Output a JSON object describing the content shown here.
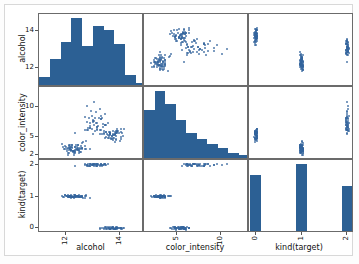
{
  "figure": {
    "kind": "scatterplot-matrix",
    "accent_color": "#2c6094",
    "point_color": "#32639b",
    "axis_color": "#6b6b6b"
  },
  "variables": [
    "alcohol",
    "color_intensity",
    "kind(target)"
  ],
  "axis_labels": {
    "x": [
      "alcohol",
      "color_intensity",
      "kind(target)"
    ],
    "y": [
      "alcohol",
      "color_intensity",
      "kind(target)"
    ]
  },
  "ticks": {
    "alcohol_x": [
      "12",
      "14"
    ],
    "alcohol_y": [
      "12",
      "14"
    ],
    "color_intensity_x": [
      "5",
      "10"
    ],
    "color_intensity_y": [
      "2",
      "5",
      "10"
    ],
    "target_x": [
      "0",
      "1",
      "2"
    ],
    "target_y": [
      "0",
      "1",
      "2"
    ]
  },
  "chart_data": {
    "type": "scatter",
    "title": "",
    "subtitle": "",
    "layout": "3x3 pair plot (scatter matrix); diagonal = histograms",
    "grid": false,
    "legend": "none",
    "variables": [
      {
        "name": "alcohol",
        "xlim": [
          11.0,
          14.9
        ],
        "ylim": [
          11.0,
          14.9
        ],
        "ticks": [
          12,
          14
        ]
      },
      {
        "name": "color_intensity",
        "xlim": [
          1.2,
          13.2
        ],
        "ylim": [
          1.2,
          13.2
        ],
        "ticks": [
          2,
          5,
          10
        ]
      },
      {
        "name": "kind(target)",
        "xlim": [
          -0.15,
          2.15
        ],
        "ylim": [
          -0.15,
          2.15
        ],
        "ticks": [
          0,
          1,
          2
        ]
      }
    ],
    "panels": [
      {
        "row": 0,
        "col": 0,
        "type": "histogram",
        "xlabel": "alcohol",
        "ylabel": "alcohol",
        "bin_edges": [
          11.0,
          11.4,
          11.8,
          12.2,
          12.6,
          13.0,
          13.4,
          13.8,
          14.2,
          14.6,
          15.0
        ],
        "counts": [
          4,
          13,
          22,
          34,
          20,
          30,
          28,
          21,
          5,
          1
        ]
      },
      {
        "row": 0,
        "col": 1,
        "type": "scatter",
        "xlabel": "color_intensity",
        "ylabel": "alcohol",
        "n_points": 178,
        "xlim": [
          1.2,
          13.2
        ],
        "ylim": [
          11.0,
          14.9
        ]
      },
      {
        "row": 0,
        "col": 2,
        "type": "strip",
        "xlabel": "kind(target)",
        "ylabel": "alcohol",
        "categories": [
          0,
          1,
          2
        ],
        "ylim": [
          11.0,
          14.9
        ]
      },
      {
        "row": 1,
        "col": 0,
        "type": "scatter",
        "xlabel": "alcohol",
        "ylabel": "color_intensity",
        "n_points": 178,
        "xlim": [
          11.0,
          14.9
        ],
        "ylim": [
          1.2,
          13.2
        ]
      },
      {
        "row": 1,
        "col": 1,
        "type": "histogram",
        "xlabel": "color_intensity",
        "ylabel": "color_intensity",
        "bin_edges": [
          1.2,
          2.4,
          3.6,
          4.8,
          6.0,
          7.2,
          8.4,
          9.6,
          10.8,
          12.0,
          13.2
        ],
        "counts": [
          30,
          42,
          34,
          24,
          16,
          12,
          9,
          6,
          3,
          2
        ]
      },
      {
        "row": 1,
        "col": 2,
        "type": "strip",
        "xlabel": "kind(target)",
        "ylabel": "color_intensity",
        "categories": [
          0,
          1,
          2
        ],
        "ylim": [
          1.2,
          13.2
        ]
      },
      {
        "row": 2,
        "col": 0,
        "type": "strip",
        "xlabel": "alcohol",
        "ylabel": "kind(target)",
        "categories": [
          0,
          1,
          2
        ],
        "xlim": [
          11.0,
          14.9
        ]
      },
      {
        "row": 2,
        "col": 1,
        "type": "strip",
        "xlabel": "color_intensity",
        "ylabel": "kind(target)",
        "categories": [
          0,
          1,
          2
        ],
        "xlim": [
          1.2,
          13.2
        ]
      },
      {
        "row": 2,
        "col": 2,
        "type": "bar",
        "xlabel": "kind(target)",
        "ylabel": "kind(target)",
        "categories": [
          "0",
          "1",
          "2"
        ],
        "values": [
          59,
          71,
          48
        ]
      }
    ]
  }
}
